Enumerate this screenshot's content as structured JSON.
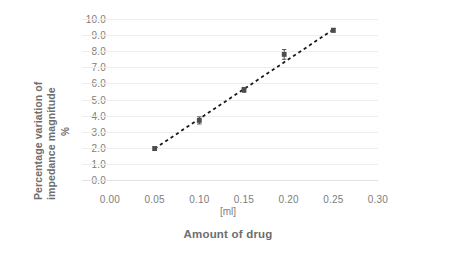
{
  "chart_data": {
    "type": "scatter",
    "title": "",
    "subtitle": "",
    "xlabel": "Amount of drug",
    "xunit": "[ml]",
    "ylabel_line1": "Percentage variation of",
    "ylabel_line2": "impedance magnitude",
    "ylabel_unit": "%",
    "xlim": [
      0.0,
      0.3
    ],
    "ylim": [
      0.0,
      10.0
    ],
    "grid": true,
    "legend": "none",
    "x_ticks": [
      "0.00",
      "0.05",
      "0.10",
      "0.15",
      "0.20",
      "0.25",
      "0.30"
    ],
    "x_tick_values": [
      0.0,
      0.05,
      0.1,
      0.15,
      0.2,
      0.25,
      0.3
    ],
    "y_ticks": [
      "0.0",
      "1.0",
      "2.0",
      "3.0",
      "4.0",
      "5.0",
      "6.0",
      "7.0",
      "8.0",
      "9.0",
      "10.0"
    ],
    "y_tick_values": [
      0.0,
      1.0,
      2.0,
      3.0,
      4.0,
      5.0,
      6.0,
      7.0,
      8.0,
      9.0,
      10.0
    ],
    "x": [
      0.05,
      0.1,
      0.15,
      0.195,
      0.25
    ],
    "values": [
      1.95,
      3.7,
      5.6,
      7.8,
      9.3
    ],
    "y_error": [
      0.12,
      0.22,
      0.15,
      0.3,
      0.12
    ],
    "series": [
      {
        "name": "Percentage variation of impedance magnitude",
        "marker": "square",
        "marker_color": "#4d4d4d",
        "line_style": "dashed",
        "line_color": "#1a1a1a",
        "points": [
          {
            "x": 0.05,
            "y": 1.95,
            "err": 0.12
          },
          {
            "x": 0.1,
            "y": 3.7,
            "err": 0.22
          },
          {
            "x": 0.15,
            "y": 5.6,
            "err": 0.15
          },
          {
            "x": 0.195,
            "y": 7.8,
            "err": 0.3
          },
          {
            "x": 0.25,
            "y": 9.3,
            "err": 0.12
          }
        ]
      }
    ],
    "trendline": {
      "style": "dashed",
      "color": "#1a1a1a",
      "from": {
        "x": 0.05,
        "y": 1.95
      },
      "to": {
        "x": 0.25,
        "y": 9.35
      }
    },
    "colors": {
      "background": "#ffffff",
      "grid": "#ededed",
      "axis": "#e3e3e3",
      "text": "#7d7d7d",
      "title_text": "#6e6e6e",
      "marker": "#4d4d4d",
      "line": "#1a1a1a"
    }
  }
}
